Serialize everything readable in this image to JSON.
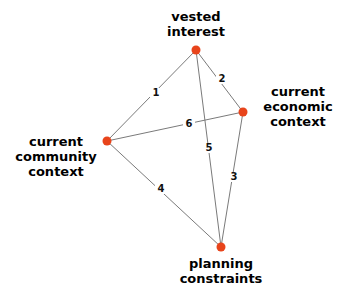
{
  "diagram": {
    "type": "undirected-graph",
    "node_color": "#e8441b",
    "edge_color": "#7a7a7a",
    "background_color": "#ffffff",
    "nodes": [
      {
        "id": "vested-interest",
        "label_line1": "vested",
        "label_line2": "interest",
        "label_line3": "",
        "x": 196,
        "y": 50
      },
      {
        "id": "current-economic-context",
        "label_line1": "current",
        "label_line2": "economic",
        "label_line3": "context",
        "x": 243,
        "y": 112
      },
      {
        "id": "current-community-context",
        "label_line1": "current",
        "label_line2": "community",
        "label_line3": "context",
        "x": 107,
        "y": 141
      },
      {
        "id": "planning-constraints",
        "label_line1": "planning",
        "label_line2": "constraints",
        "label_line3": "",
        "x": 221,
        "y": 247
      }
    ],
    "edges": [
      {
        "id": "edge-1",
        "label": "1",
        "from": "vested-interest",
        "to": "current-community-context",
        "label_x": 155,
        "label_y": 93
      },
      {
        "id": "edge-2",
        "label": "2",
        "from": "vested-interest",
        "to": "current-economic-context",
        "label_x": 221,
        "label_y": 79
      },
      {
        "id": "edge-3",
        "label": "3",
        "from": "current-economic-context",
        "to": "planning-constraints",
        "label_x": 233,
        "label_y": 177
      },
      {
        "id": "edge-4",
        "label": "4",
        "from": "current-community-context",
        "to": "planning-constraints",
        "label_x": 160,
        "label_y": 189
      },
      {
        "id": "edge-5",
        "label": "5",
        "from": "vested-interest",
        "to": "planning-constraints",
        "label_x": 208,
        "label_y": 148
      },
      {
        "id": "edge-6",
        "label": "6",
        "from": "current-community-context",
        "to": "current-economic-context",
        "label_x": 188,
        "label_y": 124
      }
    ]
  }
}
